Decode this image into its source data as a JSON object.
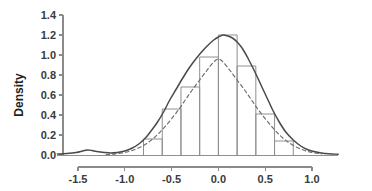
{
  "chart_data": {
    "type": "bar",
    "title": "",
    "subtitle": "",
    "xlabel": "",
    "ylabel": "Density",
    "xlim": [
      -1.72,
      1.28
    ],
    "ylim": [
      0.0,
      1.4
    ],
    "grid": false,
    "legend": "none",
    "x_ticks": [
      -1.5,
      -1.0,
      -0.5,
      0.0,
      0.5,
      1.0
    ],
    "x_tick_labels": [
      "-1.5",
      "-1.0",
      "-0.5",
      "0.0",
      "0.5",
      "1.0"
    ],
    "y_ticks": [
      0.0,
      0.2,
      0.4,
      0.6,
      0.8,
      1.0,
      1.2,
      1.4
    ],
    "y_tick_labels": [
      "0.0",
      "0.2",
      "0.4",
      "0.6",
      "0.8",
      "1.0",
      "1.2",
      "1.4"
    ],
    "bin_edges": [
      -0.8,
      -0.6,
      -0.4,
      -0.2,
      0.0,
      0.2,
      0.4,
      0.6,
      0.8
    ],
    "bin_width": 0.2,
    "categories": [
      "-0.8 to -0.6",
      "-0.6 to -0.4",
      "-0.4 to -0.2",
      "-0.2 to 0.0",
      "0.0 to 0.2",
      "0.2 to 0.4",
      "0.4 to 0.6",
      "0.6 to 0.8"
    ],
    "values": [
      0.16,
      0.46,
      0.68,
      0.98,
      1.2,
      0.89,
      0.41,
      0.14
    ],
    "series": [
      {
        "name": "histogram",
        "style": "bar-outline",
        "values": [
          0.16,
          0.46,
          0.68,
          0.98,
          1.2,
          0.89,
          0.41,
          0.14
        ]
      },
      {
        "name": "kernel-density-estimate",
        "style": "solid-line",
        "x": [
          -1.72,
          -1.62,
          -1.52,
          -1.45,
          -1.4,
          -1.35,
          -1.3,
          -1.22,
          -1.15,
          -1.08,
          -1.0,
          -0.92,
          -0.85,
          -0.78,
          -0.72,
          -0.65,
          -0.58,
          -0.52,
          -0.45,
          -0.38,
          -0.32,
          -0.25,
          -0.18,
          -0.12,
          -0.05,
          0.0,
          0.05,
          0.1,
          0.15,
          0.2,
          0.26,
          0.32,
          0.38,
          0.45,
          0.52,
          0.58,
          0.65,
          0.72,
          0.8,
          0.88,
          0.95,
          1.02,
          1.1,
          1.18,
          1.28
        ],
        "y": [
          0.01,
          0.015,
          0.025,
          0.04,
          0.05,
          0.045,
          0.035,
          0.025,
          0.02,
          0.025,
          0.04,
          0.07,
          0.11,
          0.17,
          0.24,
          0.33,
          0.44,
          0.55,
          0.66,
          0.77,
          0.86,
          0.95,
          1.03,
          1.09,
          1.15,
          1.18,
          1.2,
          1.19,
          1.17,
          1.13,
          1.06,
          0.96,
          0.85,
          0.71,
          0.57,
          0.45,
          0.33,
          0.23,
          0.15,
          0.09,
          0.055,
          0.035,
          0.02,
          0.012,
          0.008
        ]
      },
      {
        "name": "normal-reference-curve",
        "style": "dashed-line",
        "mean": 0.0,
        "sd": 0.362,
        "peak": 1.1,
        "x": [
          -1.2,
          -1.1,
          -1.0,
          -0.9,
          -0.8,
          -0.72,
          -0.65,
          -0.58,
          -0.5,
          -0.42,
          -0.35,
          -0.28,
          -0.2,
          -0.12,
          -0.05,
          0.0,
          0.05,
          0.12,
          0.2,
          0.28,
          0.35,
          0.42,
          0.5,
          0.58,
          0.65,
          0.72,
          0.8,
          0.9,
          1.0,
          1.1
        ],
        "y": [
          0.005,
          0.012,
          0.026,
          0.052,
          0.095,
          0.146,
          0.204,
          0.273,
          0.363,
          0.46,
          0.556,
          0.65,
          0.75,
          0.85,
          0.93,
          0.96,
          0.93,
          0.85,
          0.75,
          0.65,
          0.556,
          0.46,
          0.363,
          0.273,
          0.204,
          0.146,
          0.095,
          0.052,
          0.026,
          0.012
        ]
      }
    ],
    "colors": {
      "axis": "#8a8a8a",
      "bar_stroke": "#8f8f8f",
      "density_line": "#4a4a4a",
      "normal_line": "#6e6e6e",
      "tick_text": "#3a3a3a",
      "axis_title": "#1f1f1f",
      "background": "#ffffff"
    }
  }
}
